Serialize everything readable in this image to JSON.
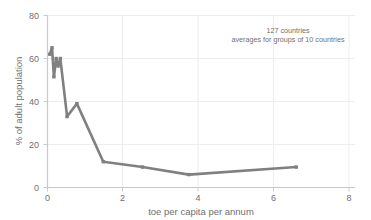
{
  "chart_data": {
    "type": "line",
    "title": "",
    "xlabel": "toe per capita per annum",
    "ylabel": "% of adult population",
    "xlim": [
      0,
      8
    ],
    "ylim": [
      0,
      80
    ],
    "xticks": [
      0,
      2,
      4,
      6,
      8
    ],
    "yticks": [
      0,
      20,
      40,
      60,
      80
    ],
    "xtick_labels": [
      "0",
      "2",
      "4",
      "6",
      "8"
    ],
    "ytick_labels": [
      "0",
      "20",
      "40",
      "60",
      "80"
    ],
    "grid": true,
    "legend": false,
    "series": [
      {
        "name": "averages for groups of 10 countries",
        "color": "#808080",
        "marker": "square",
        "x": [
          0.06,
          0.12,
          0.17,
          0.23,
          0.28,
          0.34,
          0.52,
          0.78,
          1.48,
          2.52,
          3.75,
          6.6
        ],
        "y": [
          62.0,
          65.0,
          51.5,
          60.0,
          56.5,
          60.0,
          33.0,
          39.0,
          12.0,
          9.5,
          6.0,
          9.5
        ]
      }
    ],
    "annotations": [
      {
        "text": "127 countries",
        "x": 5.3,
        "y": 74
      },
      {
        "text": "averages for groups of 10 countries",
        "x": 5.3,
        "y": 70
      }
    ]
  },
  "axis": {
    "x_title": "toe per capita per annum",
    "y_title": "% of adult population"
  },
  "annotation": {
    "line1": "127 countries",
    "line2": "averages for groups of 10 countries"
  },
  "colors": {
    "series": "#808080",
    "grid": "#ededed",
    "axis": "#c9c9c9",
    "text": "#6f6f6f"
  }
}
